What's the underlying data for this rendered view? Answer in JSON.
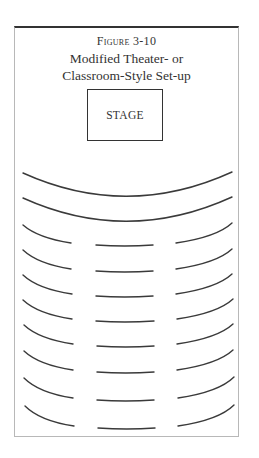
{
  "figure": {
    "label": "Figure 3-10",
    "title_line_1": "Modified Theater- or",
    "title_line_2": "Classroom-Style Set-up"
  },
  "stage": {
    "label": "STAGE"
  },
  "layout": {
    "full_arc_rows": 2,
    "split_rows": 8,
    "split_row_segments": [
      "left-curve",
      "center-straight",
      "right-curve"
    ],
    "line_color": "#3a3a3a",
    "frame_top_color": "#333333",
    "frame_side_color": "#b8b8b8"
  }
}
